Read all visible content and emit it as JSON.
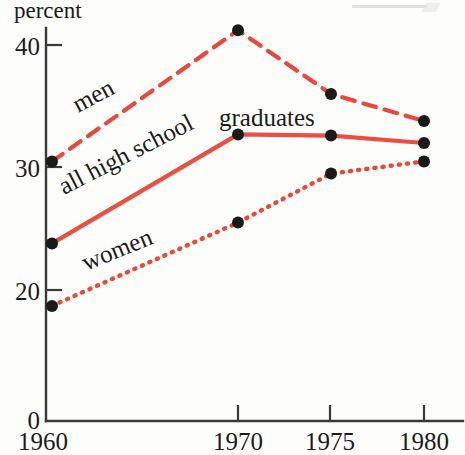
{
  "chart_data": {
    "type": "line",
    "title": "",
    "ylabel": "percent",
    "xlabel": "",
    "categories": [
      "1960",
      "1970",
      "1975",
      "1980"
    ],
    "x": [
      1960,
      1970,
      1975,
      1980
    ],
    "xlim": [
      1960,
      1980
    ],
    "ylim": [
      0,
      42
    ],
    "grid": false,
    "legend_position": "inline-labels",
    "y_ticks": [
      "0",
      "20",
      "30",
      "40"
    ],
    "y_tick_values": [
      0,
      20,
      30,
      40
    ],
    "x_ticks": [
      "1960",
      "1970",
      "1975",
      "1980"
    ],
    "series": [
      {
        "name": "men",
        "style": "dashed",
        "color": "#E8493C",
        "values": [
          30.5,
          41.2,
          36.0,
          33.8
        ]
      },
      {
        "name": "all high school graduates",
        "style": "solid",
        "color": "#EC4E3F",
        "values": [
          23.8,
          32.7,
          32.6,
          32.0
        ]
      },
      {
        "name": "women",
        "style": "dotted",
        "color": "#E8493C",
        "values": [
          18.7,
          25.5,
          29.5,
          30.5
        ]
      }
    ],
    "annotations": [
      {
        "text": "men",
        "rotation": -28
      },
      {
        "text": "all high school",
        "rotation": -27
      },
      {
        "text": "graduates",
        "rotation": 0
      },
      {
        "text": "women",
        "rotation": -22
      }
    ]
  },
  "labels": {
    "percent": "percent",
    "y_40": "40",
    "y_30": "30",
    "y_20": "20",
    "y_0": "0",
    "x_1960": "1960",
    "x_1970": "1970",
    "x_1975": "1975",
    "x_1980": "1980",
    "men": "men",
    "all_high_school": "all high school",
    "graduates": "graduates",
    "women": "women"
  },
  "colors": {
    "line_red": "#E8493C",
    "axis_black": "#3a3a38",
    "marker_black": "#1a1a1a",
    "background": "#fdfdfb"
  }
}
